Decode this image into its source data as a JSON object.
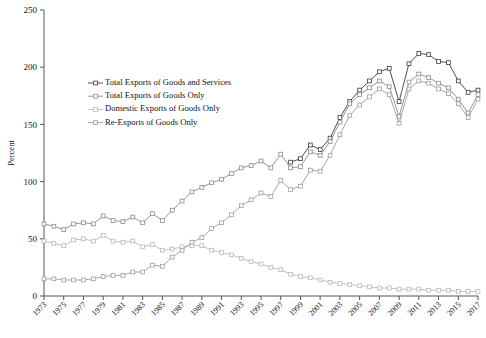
{
  "chart_data": {
    "type": "line",
    "title": "",
    "xlabel": "",
    "ylabel": "Percent",
    "ylim": [
      0,
      250
    ],
    "ytick_values": [
      0,
      50,
      100,
      150,
      200,
      250
    ],
    "xlim": [
      1973,
      2017
    ],
    "grid": false,
    "legend_position": "upper-left-inside",
    "x": [
      1973,
      1974,
      1975,
      1976,
      1977,
      1978,
      1979,
      1980,
      1981,
      1982,
      1983,
      1984,
      1985,
      1986,
      1987,
      1988,
      1989,
      1990,
      1991,
      1992,
      1993,
      1994,
      1995,
      1996,
      1997,
      1998,
      1999,
      2000,
      2001,
      2002,
      2003,
      2004,
      2005,
      2006,
      2007,
      2008,
      2009,
      2010,
      2011,
      2012,
      2013,
      2014,
      2015,
      2016,
      2017
    ],
    "xtick_labels": [
      "1973",
      "1975",
      "1977",
      "1979",
      "1981",
      "1983",
      "1985",
      "1987",
      "1989",
      "1991",
      "1993",
      "1995",
      "1997",
      "1999",
      "2001",
      "2003",
      "2005",
      "2007",
      "2009",
      "2011",
      "2013",
      "2015",
      "2017"
    ],
    "series": [
      {
        "name": "Total Exports of Goods and Services",
        "color": "#3a3a3a",
        "marker": "square-open",
        "start_year": 1998,
        "values": [
          null,
          null,
          null,
          null,
          null,
          null,
          null,
          null,
          null,
          null,
          null,
          null,
          null,
          null,
          null,
          null,
          null,
          null,
          null,
          null,
          null,
          null,
          null,
          null,
          null,
          117,
          120,
          132,
          128,
          138,
          156,
          170,
          180,
          188,
          196,
          199,
          170,
          203,
          212,
          211,
          205,
          204,
          188,
          178,
          180
        ]
      },
      {
        "name": "Total Exports of Goods Only",
        "color": "#8a8a8a",
        "marker": "square-open",
        "start_year": 1973,
        "values": [
          63,
          61,
          58,
          63,
          64,
          63,
          70,
          66,
          65,
          69,
          64,
          72,
          66,
          75,
          83,
          91,
          95,
          99,
          102,
          107,
          112,
          114,
          118,
          112,
          124,
          112,
          113,
          126,
          123,
          135,
          152,
          168,
          176,
          182,
          188,
          183,
          157,
          187,
          194,
          191,
          186,
          182,
          172,
          160,
          176
        ]
      },
      {
        "name": "Domestic Exports of Goods Only",
        "color": "#b8b8b8",
        "marker": "square-open",
        "start_year": 1973,
        "values": [
          48,
          46,
          44,
          49,
          50,
          48,
          53,
          48,
          47,
          48,
          43,
          45,
          40,
          41,
          43,
          44,
          44,
          40,
          38,
          36,
          33,
          30,
          28,
          25,
          23,
          19,
          17,
          16,
          14,
          12,
          11,
          10,
          9,
          8,
          7,
          7,
          6,
          6,
          6,
          5,
          5,
          5,
          4,
          4,
          4
        ]
      },
      {
        "name": "Re-Exports of Goods Only",
        "color": "#9d9d9d",
        "marker": "square-open",
        "start_year": 1973,
        "values": [
          15,
          15,
          14,
          14,
          14,
          15,
          17,
          18,
          18,
          21,
          21,
          27,
          26,
          34,
          40,
          47,
          51,
          59,
          64,
          71,
          79,
          84,
          90,
          87,
          101,
          93,
          96,
          110,
          109,
          123,
          141,
          158,
          167,
          174,
          181,
          176,
          151,
          181,
          188,
          186,
          181,
          177,
          168,
          156,
          172
        ]
      }
    ]
  },
  "legend": {
    "items": [
      {
        "label": "Total Exports of Goods and Services"
      },
      {
        "label": "Total Exports of Goods Only"
      },
      {
        "label": "Domestic Exports of Goods Only"
      },
      {
        "label": "Re-Exports of Goods Only"
      }
    ]
  }
}
